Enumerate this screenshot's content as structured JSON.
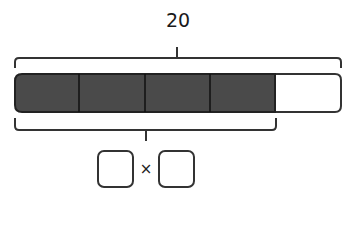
{
  "diagram": {
    "total_label": "20",
    "bar": {
      "total_parts": 5,
      "shaded_parts": 4,
      "shaded_color": "#4a4a4a",
      "unshaded_color": "#ffffff"
    },
    "expression": {
      "operator": "×",
      "left_box": "",
      "right_box": ""
    }
  }
}
